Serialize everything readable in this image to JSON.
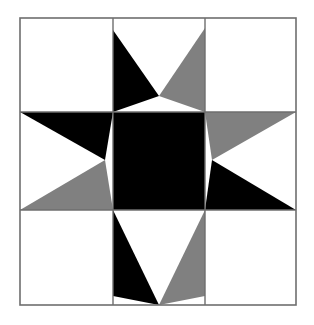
{
  "figure": {
    "kind": "quilt-block-diagram",
    "canvas": {
      "width": 314,
      "height": 325,
      "background": "#FFFFFF"
    }
  },
  "colors": {
    "dark": "#000000",
    "medium": "#808080",
    "light": "#FFFFFF",
    "outline": "#6E6E6E",
    "grid_line": "#6E6E6E",
    "background": "#FFFFFF"
  },
  "block": {
    "outer_border": {
      "x": 20,
      "y": 18,
      "width": 276,
      "height": 287,
      "stroke_width": 1.6
    },
    "grid": {
      "rows": 3,
      "cols": 3,
      "vertical_lines": [
        113,
        205
      ],
      "horizontal_lines": [
        112,
        210
      ],
      "col_edges": [
        20,
        113,
        205,
        296
      ],
      "row_edges": [
        18,
        112,
        210,
        305
      ]
    },
    "center_apex": {
      "x": 159,
      "y": 160
    },
    "patches": [
      {
        "name": "corner-top-left",
        "row": 0,
        "col": 0,
        "fill": "#FFFFFF"
      },
      {
        "name": "corner-top-right",
        "row": 0,
        "col": 2,
        "fill": "#FFFFFF"
      },
      {
        "name": "corner-bottom-left",
        "row": 2,
        "col": 0,
        "fill": "#FFFFFF"
      },
      {
        "name": "corner-bottom-right",
        "row": 2,
        "col": 2,
        "fill": "#FFFFFF"
      },
      {
        "name": "center-square",
        "row": 1,
        "col": 1,
        "fill": "#000000"
      },
      {
        "name": "star-point-top-dark",
        "fill": "#000000",
        "points": "113,30 159,96 113,112"
      },
      {
        "name": "star-point-top-medium",
        "fill": "#808080",
        "points": "205,28 205,112 159,96"
      },
      {
        "name": "star-point-left-dark",
        "fill": "#000000",
        "points": "113,112 20,112 105,160"
      },
      {
        "name": "star-point-left-medium",
        "fill": "#808080",
        "points": "105,160 20,210 113,210"
      },
      {
        "name": "star-point-right-medium",
        "fill": "#808080",
        "points": "205,112 296,112 212,160"
      },
      {
        "name": "star-point-right-dark",
        "fill": "#000000",
        "points": "212,160 296,210 205,210"
      },
      {
        "name": "star-point-bottom-dark",
        "fill": "#000000",
        "points": "113,210 159,305 113,296"
      },
      {
        "name": "star-point-bottom-medium",
        "fill": "#808080",
        "points": "159,305 205,210 205,296"
      }
    ]
  },
  "chart_data": {
    "type": "diagram",
    "grid_rows": 3,
    "grid_cols": 3,
    "star_points": 8,
    "palette": [
      "#000000",
      "#808080",
      "#FFFFFF"
    ],
    "fill_counts": {
      "black": 5,
      "gray": 4,
      "white": 4
    },
    "symmetry": "4-fold rotational (alternating black / gray half-points)"
  }
}
